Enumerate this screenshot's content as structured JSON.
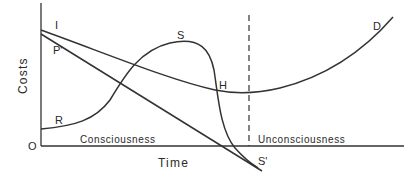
{
  "diagram": {
    "axis": {
      "ylabel": "Costs",
      "xlabel": "Time",
      "origin": "O"
    },
    "regions": {
      "left": "Consciousness",
      "right": "Unconsciousness"
    },
    "curve_labels": {
      "I": "I",
      "P": "P'",
      "S": "S",
      "H": "H",
      "R": "R",
      "D": "D",
      "S_prime": "S'"
    },
    "colors": {
      "line": "#333333",
      "background": "#ffffff"
    }
  }
}
